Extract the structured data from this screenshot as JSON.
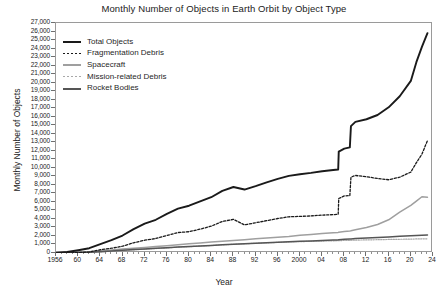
{
  "chart_data": {
    "type": "line",
    "title": "Monthly Number of Objects in Earth Orbit by Object Type",
    "xlabel": "Year",
    "ylabel": "Monthly Number of Objects",
    "xlim": [
      1956,
      2024
    ],
    "ylim": [
      0,
      27000
    ],
    "ytick_step": 1000,
    "xtick_step": 4,
    "xminor_step": 1,
    "grid": false,
    "legend_position": "upper-left",
    "ytick_labels": [
      "0",
      "1,000",
      "2,000",
      "3,000",
      "4,000",
      "5,000",
      "6,000",
      "7,000",
      "8,000",
      "9,000",
      "10,000",
      "11,000",
      "12,000",
      "13,000",
      "14,000",
      "15,000",
      "16,000",
      "17,000",
      "18,000",
      "19,000",
      "20,000",
      "21,000",
      "22,000",
      "23,000",
      "24,000",
      "25,000",
      "26,000",
      "27,000"
    ],
    "xtick_labels": [
      "1956",
      "60",
      "64",
      "68",
      "72",
      "76",
      "80",
      "84",
      "88",
      "92",
      "96",
      "2000",
      "04",
      "08",
      "12",
      "16",
      "20",
      "24"
    ],
    "xtick_values": [
      1956,
      1960,
      1964,
      1968,
      1972,
      1976,
      1980,
      1984,
      1988,
      1992,
      1996,
      2000,
      2004,
      2008,
      2012,
      2016,
      2020,
      2024
    ],
    "x": [
      1956,
      1958,
      1960,
      1962,
      1964,
      1966,
      1968,
      1970,
      1972,
      1974,
      1976,
      1978,
      1980,
      1982,
      1984,
      1986,
      1988,
      1990,
      1992,
      1994,
      1996,
      1998,
      2000,
      2002,
      2004,
      2006,
      2006.9,
      2007,
      2008,
      2009,
      2009.2,
      2010,
      2012,
      2014,
      2016,
      2018,
      2020,
      2021,
      2022,
      2023
    ],
    "series": [
      {
        "name": "Total Objects",
        "style": "solid-thick",
        "color": "#1a1a1a",
        "values": [
          0,
          120,
          330,
          560,
          1050,
          1500,
          2050,
          2800,
          3450,
          3900,
          4600,
          5200,
          5550,
          6050,
          6550,
          7300,
          7750,
          7450,
          7850,
          8300,
          8700,
          9050,
          9250,
          9400,
          9600,
          9750,
          9800,
          11900,
          12250,
          12400,
          14900,
          15400,
          15700,
          16200,
          17100,
          18400,
          20200,
          22400,
          24200,
          25800
        ]
      },
      {
        "name": "Fragmentation Debris",
        "style": "dotted",
        "color": "#1a1a1a",
        "values": [
          0,
          10,
          40,
          120,
          380,
          560,
          800,
          1200,
          1500,
          1700,
          2050,
          2400,
          2500,
          2800,
          3150,
          3700,
          3950,
          3300,
          3550,
          3800,
          4050,
          4250,
          4300,
          4350,
          4450,
          4500,
          4550,
          6400,
          6700,
          6750,
          8900,
          9100,
          8950,
          8750,
          8600,
          8900,
          9500,
          10600,
          11600,
          13200
        ]
      },
      {
        "name": "Spacecraft",
        "style": "solid-light",
        "color": "#9f9f9f",
        "values": [
          0,
          30,
          90,
          160,
          260,
          360,
          460,
          560,
          660,
          760,
          860,
          980,
          1090,
          1180,
          1280,
          1380,
          1470,
          1560,
          1660,
          1750,
          1850,
          1950,
          2080,
          2180,
          2280,
          2390,
          2420,
          2450,
          2520,
          2580,
          2600,
          2720,
          3000,
          3350,
          3900,
          4800,
          5600,
          6100,
          6600,
          6550
        ]
      },
      {
        "name": "Mission-related Debris",
        "style": "dotted-light",
        "color": "#a8a8a8",
        "values": [
          0,
          10,
          30,
          70,
          140,
          210,
          290,
          370,
          450,
          520,
          600,
          680,
          740,
          810,
          880,
          960,
          1020,
          1080,
          1140,
          1190,
          1240,
          1290,
          1330,
          1370,
          1400,
          1430,
          1440,
          1450,
          1470,
          1480,
          1490,
          1510,
          1540,
          1560,
          1590,
          1610,
          1630,
          1650,
          1660,
          1670
        ]
      },
      {
        "name": "Rocket Bodies",
        "style": "solid-medium",
        "color": "#555555",
        "values": [
          0,
          15,
          45,
          90,
          160,
          240,
          320,
          400,
          480,
          550,
          620,
          700,
          760,
          820,
          890,
          960,
          1020,
          1080,
          1140,
          1200,
          1260,
          1320,
          1370,
          1420,
          1470,
          1520,
          1540,
          1560,
          1600,
          1640,
          1650,
          1690,
          1750,
          1810,
          1880,
          1960,
          2020,
          2060,
          2090,
          2100
        ]
      }
    ]
  }
}
